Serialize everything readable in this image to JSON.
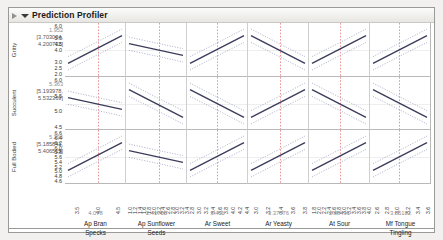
{
  "window": {
    "title": "Prediction Profiler",
    "disclosure_icon": "triangle-down-icon",
    "grip_icon": "grip-icon"
  },
  "chart_data": {
    "type": "line",
    "title": "Prediction Profiler",
    "grid": true,
    "legend": "none",
    "rows": [
      {
        "label": "Gritty",
        "current_value": "1.952",
        "ci": "[3.703034, 4.200732]",
        "ylim": [
          2.0,
          6.0
        ],
        "yticks": [
          "6.0",
          "5.0",
          "4.5",
          "4.0",
          "3.0",
          "2.5",
          "2.0"
        ],
        "ytick_values": [
          6.0,
          5.0,
          4.5,
          4.0,
          3.0,
          2.5,
          2.0
        ],
        "traces": [
          {
            "column": "Ap Bran Specks",
            "start": 3.1,
            "end": 4.6,
            "shape": "up"
          },
          {
            "column": "Ap Sunflower Seeds",
            "start": 4.0,
            "end": 3.8,
            "shape": "flat"
          },
          {
            "column": "Ar Sweet",
            "start": 3.4,
            "end": 4.6,
            "shape": "up"
          },
          {
            "column": "Ar Yeasty",
            "start": 4.6,
            "end": 3.4,
            "shape": "down"
          },
          {
            "column": "At Sour",
            "start": 3.5,
            "end": 4.4,
            "shape": "up"
          },
          {
            "column": "Mf Tongue Tingling",
            "start": 3.4,
            "end": 4.5,
            "shape": "up"
          }
        ]
      },
      {
        "label": "Succulent",
        "current_value": "5.363",
        "ci": "[5.193978, 5.532369]",
        "ylim": [
          4.5,
          6.0
        ],
        "yticks": [
          "6.0",
          "5.5",
          "5.0",
          "4.5"
        ],
        "ytick_values": [
          6.0,
          5.5,
          5.0,
          4.5
        ],
        "traces": [
          {
            "column": "Ap Bran Specks",
            "start": 5.42,
            "end": 5.3,
            "shape": "flat-down"
          },
          {
            "column": "Ap Sunflower Seeds",
            "start": 5.52,
            "end": 5.15,
            "shape": "down"
          },
          {
            "column": "Ar Sweet",
            "start": 5.55,
            "end": 5.05,
            "shape": "down"
          },
          {
            "column": "Ar Yeasty",
            "start": 5.25,
            "end": 5.5,
            "shape": "up"
          },
          {
            "column": "At Sour",
            "start": 5.45,
            "end": 5.15,
            "shape": "down"
          },
          {
            "column": "Mf Tongue Tingling",
            "start": 5.6,
            "end": 4.95,
            "shape": "down"
          }
        ]
      },
      {
        "label": "Full Bodied",
        "current_value": "5.296",
        "ci": "[5.185841, 5.406515]",
        "ylim": [
          4.6,
          6.6
        ],
        "yticks": [
          "6.6",
          "6.4",
          "6.2",
          "6.0",
          "5.8",
          "5.6",
          "5.4",
          "5.2",
          "5.0",
          "4.8",
          "4.6"
        ],
        "ytick_values": [
          6.6,
          6.4,
          6.2,
          6.0,
          5.8,
          5.6,
          5.4,
          5.2,
          5.0,
          4.8,
          4.6
        ],
        "traces": [
          {
            "column": "Ap Bran Specks",
            "start": 5.05,
            "end": 5.55,
            "shape": "up"
          },
          {
            "column": "Ap Sunflower Seeds",
            "start": 5.35,
            "end": 5.2,
            "shape": "flat-down"
          },
          {
            "column": "Ar Sweet",
            "start": 5.05,
            "end": 5.6,
            "shape": "up"
          },
          {
            "column": "Ar Yeasty",
            "start": 5.1,
            "end": 5.55,
            "shape": "up"
          },
          {
            "column": "At Sour",
            "start": 5.1,
            "end": 5.55,
            "shape": "up"
          },
          {
            "column": "Mf Tongue Tingling",
            "start": 5.1,
            "end": 5.55,
            "shape": "up"
          }
        ]
      }
    ],
    "columns": [
      {
        "label_line1": "Ap Bran",
        "label_line2": "Specks",
        "current_value": "4.078",
        "xticks": [
          "3.5",
          "4.0",
          "4.5"
        ],
        "marker_pos": 0.55
      },
      {
        "label_line1": "Ap Sunflower",
        "label_line2": "Seeds",
        "current_value": "2.41755",
        "xticks": [
          "1.0",
          "1.2",
          "1.4",
          "1.6",
          "1.8",
          "2.0",
          "2.2",
          "2.4",
          "2.6",
          "2.8",
          "3.0",
          "3.2",
          "3.4"
        ],
        "marker_pos": 0.56
      },
      {
        "label_line1": "Ar Sweet",
        "label_line2": "",
        "current_value": "3.411",
        "xticks": [
          "2.8",
          "3.0",
          "3.2",
          "3.4",
          "3.6",
          "3.8",
          "4.0",
          "4.2",
          "4.4"
        ],
        "marker_pos": 0.5
      },
      {
        "label_line1": "Ar Yeasty",
        "label_line2": "",
        "current_value": "3.37876",
        "xticks": [
          "3.0",
          "3.2",
          "3.4",
          "3.6",
          "3.8"
        ],
        "marker_pos": 0.53
      },
      {
        "label_line1": "At Sour",
        "label_line2": "",
        "current_value": "2.88491",
        "xticks": [
          "1.8",
          "2.0",
          "2.2",
          "2.4",
          "2.6",
          "2.8",
          "3.0",
          "3.2",
          "3.4",
          "3.6",
          "3.8",
          "4.0"
        ],
        "marker_pos": 0.52
      },
      {
        "label_line1": "Mf Tongue",
        "label_line2": "Tingling",
        "current_value": "3.05182",
        "xticks": [
          "2.6",
          "2.8",
          "3.0",
          "3.2",
          "3.4",
          "3.6"
        ],
        "marker_pos": 0.48
      }
    ],
    "colors": {
      "trace": "#3b3b5c",
      "confidence_band": "#8a8ab0",
      "crosshair": "#e88a8a",
      "grid": "#cfcfcf",
      "axis": "#b9b9b9"
    }
  }
}
